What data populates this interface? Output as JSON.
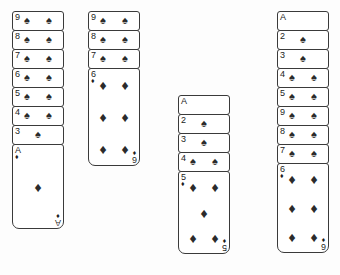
{
  "app": {
    "title": "Solitaire tableau",
    "background_color": "#fdfdfd",
    "card_face_color": "#ffffff",
    "card_border_color": "#3a3a3a",
    "pip_color": "#2b2b2b"
  },
  "glyphs": {
    "spade": "♠",
    "diamond": "♦",
    "heart": "♥",
    "club": "♣"
  },
  "columns": [
    {
      "name": "tableau-column-1",
      "x": 12,
      "y": 11,
      "width": 52,
      "collapsed_step": 19,
      "cards": [
        {
          "rank": "9",
          "suit": "spade",
          "face_up": true,
          "collapsed": true
        },
        {
          "rank": "8",
          "suit": "spade",
          "face_up": true,
          "collapsed": true
        },
        {
          "rank": "7",
          "suit": "spade",
          "face_up": true,
          "collapsed": true
        },
        {
          "rank": "6",
          "suit": "spade",
          "face_up": true,
          "collapsed": true
        },
        {
          "rank": "5",
          "suit": "spade",
          "face_up": true,
          "collapsed": true
        },
        {
          "rank": "4",
          "suit": "spade",
          "face_up": true,
          "collapsed": true
        },
        {
          "rank": "3",
          "suit": "spade",
          "face_up": true,
          "collapsed": true
        },
        {
          "rank": "A",
          "suit": "diamond",
          "face_up": true,
          "collapsed": false,
          "height": 85
        }
      ]
    },
    {
      "name": "tableau-column-2",
      "x": 88,
      "y": 11,
      "width": 52,
      "collapsed_step": 19,
      "cards": [
        {
          "rank": "9",
          "suit": "spade",
          "face_up": true,
          "collapsed": true
        },
        {
          "rank": "8",
          "suit": "spade",
          "face_up": true,
          "collapsed": true
        },
        {
          "rank": "7",
          "suit": "spade",
          "face_up": true,
          "collapsed": true
        },
        {
          "rank": "6",
          "suit": "diamond",
          "face_up": true,
          "collapsed": false,
          "height": 98
        }
      ]
    },
    {
      "name": "tableau-column-3",
      "x": 178,
      "y": 95,
      "width": 52,
      "collapsed_step": 19,
      "cards": [
        {
          "rank": "A",
          "suit": "spade",
          "face_up": true,
          "collapsed": true
        },
        {
          "rank": "2",
          "suit": "spade",
          "face_up": true,
          "collapsed": true
        },
        {
          "rank": "3",
          "suit": "spade",
          "face_up": true,
          "collapsed": true
        },
        {
          "rank": "4",
          "suit": "spade",
          "face_up": true,
          "collapsed": true
        },
        {
          "rank": "5",
          "suit": "diamond",
          "face_up": true,
          "collapsed": false,
          "height": 83
        }
      ]
    },
    {
      "name": "tableau-column-4",
      "x": 277,
      "y": 11,
      "width": 52,
      "collapsed_step": 19,
      "cards": [
        {
          "rank": "A",
          "suit": "spade",
          "face_up": true,
          "collapsed": true
        },
        {
          "rank": "2",
          "suit": "spade",
          "face_up": true,
          "collapsed": true
        },
        {
          "rank": "3",
          "suit": "spade",
          "face_up": true,
          "collapsed": true
        },
        {
          "rank": "4",
          "suit": "spade",
          "face_up": true,
          "collapsed": true
        },
        {
          "rank": "5",
          "suit": "spade",
          "face_up": true,
          "collapsed": true
        },
        {
          "rank": "9",
          "suit": "spade",
          "face_up": true,
          "collapsed": true
        },
        {
          "rank": "8",
          "suit": "spade",
          "face_up": true,
          "collapsed": true
        },
        {
          "rank": "7",
          "suit": "spade",
          "face_up": true,
          "collapsed": true
        },
        {
          "rank": "6",
          "suit": "diamond",
          "face_up": true,
          "collapsed": false,
          "height": 90
        }
      ]
    }
  ],
  "pip_layouts": {
    "A": [
      [
        50,
        50
      ]
    ],
    "2": [
      [
        50,
        22
      ],
      [
        50,
        78
      ]
    ],
    "3": [
      [
        50,
        20
      ],
      [
        50,
        50
      ],
      [
        50,
        80
      ]
    ],
    "4": [
      [
        28,
        20
      ],
      [
        72,
        20
      ],
      [
        28,
        80
      ],
      [
        72,
        80
      ]
    ],
    "5": [
      [
        28,
        18
      ],
      [
        72,
        18
      ],
      [
        50,
        50
      ],
      [
        28,
        82
      ],
      [
        72,
        82
      ]
    ],
    "6": [
      [
        28,
        17
      ],
      [
        72,
        17
      ],
      [
        28,
        50
      ],
      [
        72,
        50
      ],
      [
        28,
        83
      ],
      [
        72,
        83
      ]
    ],
    "7": [
      [
        28,
        16
      ],
      [
        72,
        16
      ],
      [
        50,
        33
      ],
      [
        28,
        50
      ],
      [
        72,
        50
      ],
      [
        28,
        84
      ],
      [
        72,
        84
      ]
    ],
    "8": [
      [
        28,
        16
      ],
      [
        72,
        16
      ],
      [
        50,
        33
      ],
      [
        28,
        50
      ],
      [
        72,
        50
      ],
      [
        50,
        67
      ],
      [
        28,
        84
      ],
      [
        72,
        84
      ]
    ],
    "9": [
      [
        28,
        15
      ],
      [
        72,
        15
      ],
      [
        28,
        38
      ],
      [
        72,
        38
      ],
      [
        50,
        50
      ],
      [
        28,
        62
      ],
      [
        72,
        62
      ],
      [
        28,
        85
      ],
      [
        72,
        85
      ]
    ]
  },
  "strip_pip_positions": {
    "A": [],
    "2": [
      50
    ],
    "3": [
      50
    ],
    "4": [
      28,
      72
    ],
    "5": [
      28,
      72
    ],
    "6": [
      28,
      72
    ],
    "7": [
      28,
      72
    ],
    "8": [
      28,
      72
    ],
    "9": [
      28,
      72
    ]
  }
}
